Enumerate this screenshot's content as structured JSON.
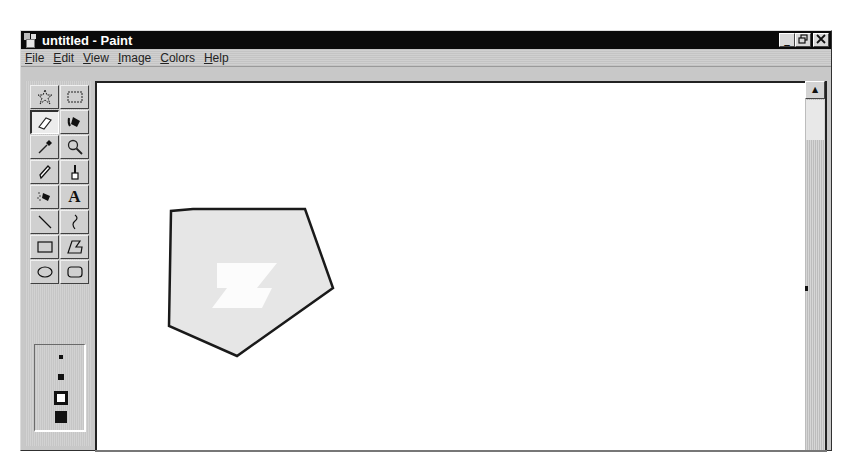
{
  "window": {
    "title": "untitled - Paint",
    "controls": {
      "minimize": "_",
      "restore": "🗗",
      "close": "✕"
    }
  },
  "menubar": {
    "items": [
      {
        "label": "File",
        "mnemonic": "F",
        "rest": "ile"
      },
      {
        "label": "Edit",
        "mnemonic": "E",
        "rest": "dit"
      },
      {
        "label": "View",
        "mnemonic": "V",
        "rest": "iew"
      },
      {
        "label": "Image",
        "mnemonic": "I",
        "rest": "mage"
      },
      {
        "label": "Colors",
        "mnemonic": "C",
        "rest": "olors"
      },
      {
        "label": "Help",
        "mnemonic": "H",
        "rest": "elp"
      }
    ]
  },
  "toolbox": {
    "tools": [
      {
        "name": "free-form-select",
        "icon": "star-select-icon",
        "active": false
      },
      {
        "name": "select",
        "icon": "rect-select-icon",
        "active": false
      },
      {
        "name": "eraser",
        "icon": "eraser-icon",
        "active": true
      },
      {
        "name": "fill-with-color",
        "icon": "paint-bucket-icon",
        "active": false
      },
      {
        "name": "pick-color",
        "icon": "eyedropper-icon",
        "active": false
      },
      {
        "name": "magnifier",
        "icon": "magnifier-icon",
        "active": false
      },
      {
        "name": "pencil",
        "icon": "pencil-icon",
        "active": false
      },
      {
        "name": "brush",
        "icon": "brush-icon",
        "active": false
      },
      {
        "name": "airbrush",
        "icon": "airbrush-icon",
        "active": false
      },
      {
        "name": "text",
        "icon": "text-icon",
        "glyph": "A",
        "active": false
      },
      {
        "name": "line",
        "icon": "line-icon",
        "active": false
      },
      {
        "name": "curve",
        "icon": "curve-icon",
        "active": false
      },
      {
        "name": "rectangle",
        "icon": "rectangle-icon",
        "active": false
      },
      {
        "name": "polygon",
        "icon": "polygon-icon",
        "active": false
      },
      {
        "name": "ellipse",
        "icon": "ellipse-icon",
        "active": false
      },
      {
        "name": "rounded-rectangle",
        "icon": "rounded-rectangle-icon",
        "active": false
      }
    ],
    "eraser_sizes": [
      {
        "size": 4,
        "selected": false
      },
      {
        "size": 6,
        "selected": false
      },
      {
        "size": 8,
        "selected": true
      },
      {
        "size": 10,
        "selected": false
      }
    ]
  },
  "canvas": {
    "background": "#ffffff",
    "polygon": {
      "points": "96,126 208,126 236,205 140,273 72,243 74,128",
      "stroke": "#1a1a1a",
      "fill": "#e6e6e6",
      "erased_region": "120,180 180,180 160,205 175,205 165,225 115,225 130,205 120,205"
    }
  },
  "scrollbar": {
    "up_arrow": "▲"
  }
}
